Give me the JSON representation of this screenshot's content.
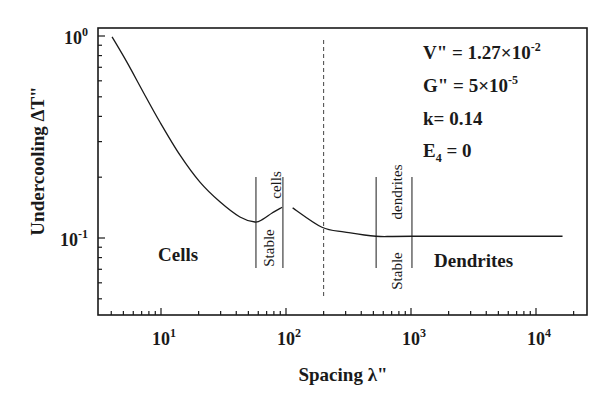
{
  "chart_data": {
    "type": "line",
    "title": "",
    "xlabel": "Spacing λ\"",
    "ylabel": "Undercooling ΔT\"",
    "xscale": "log",
    "yscale": "log",
    "xlim": [
      3.1,
      25000
    ],
    "ylim": [
      0.0415,
      1.05
    ],
    "x_ticks": [
      {
        "value": 10,
        "label": "10",
        "exp": "1"
      },
      {
        "value": 100,
        "label": "10",
        "exp": "2"
      },
      {
        "value": 1000,
        "label": "10",
        "exp": "3"
      },
      {
        "value": 10000,
        "label": "10",
        "exp": "4"
      }
    ],
    "y_ticks": [
      {
        "value": 1,
        "label": "10",
        "exp": "0"
      },
      {
        "value": 0.1,
        "label": "10",
        "exp": "-1"
      }
    ],
    "grid": false,
    "series": [
      {
        "name": "Cellular branch",
        "x": [
          4.06,
          5.35,
          7.18,
          9.8,
          14.2,
          20.5,
          29.6,
          42.8,
          56.5,
          65.5,
          77.4,
          93
        ],
        "y": [
          0.99,
          0.74,
          0.53,
          0.375,
          0.257,
          0.189,
          0.151,
          0.127,
          0.12,
          0.124,
          0.133,
          0.142
        ]
      },
      {
        "name": "Dendritic branch",
        "x": [
          113,
          194,
          297,
          524,
          1016,
          16300
        ],
        "y": [
          0.141,
          0.113,
          0.107,
          0.102,
          0.102,
          0.102
        ]
      }
    ],
    "reference_lines": [
      {
        "type": "dashed-vertical",
        "x": 200
      },
      {
        "type": "solid-vertical",
        "x": 57.5,
        "label": "Stable cells (lower bound)"
      },
      {
        "type": "solid-vertical",
        "x": 94.5,
        "label": "Stable cells (upper bound)"
      },
      {
        "type": "solid-vertical",
        "x": 526,
        "label": "Stable dendrites (lower bound)"
      },
      {
        "type": "solid-vertical",
        "x": 1018,
        "label": "Stable dendrites (upper bound)"
      }
    ],
    "annotations": {
      "region_left": "Cells",
      "region_right": "Dendrites",
      "stable_cells": [
        "Stable",
        "cells"
      ],
      "stable_dendrites": [
        "Stable",
        "dendrites"
      ],
      "params": [
        {
          "lhs": "V\" = ",
          "mant": "1.27×10",
          "exp": "-2"
        },
        {
          "lhs": "G\" = ",
          "mant": "5×10",
          "exp": "-5"
        },
        {
          "lhs": "k= ",
          "mant": "0.14",
          "exp": ""
        },
        {
          "lhs": "E",
          "sub": "4",
          "rhs": " = 0"
        }
      ]
    }
  }
}
